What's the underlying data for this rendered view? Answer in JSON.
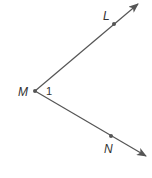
{
  "diagram": {
    "type": "angle",
    "vertex": {
      "label": "M",
      "x": 35,
      "y": 91
    },
    "rays": [
      {
        "name": "ray-ML",
        "point_label": "L",
        "point": {
          "x": 114,
          "y": 24
        },
        "tip": {
          "x": 138,
          "y": 4
        }
      },
      {
        "name": "ray-MN",
        "point_label": "N",
        "point": {
          "x": 111,
          "y": 136
        },
        "tip": {
          "x": 146,
          "y": 156
        }
      }
    ],
    "angle_label": "1",
    "colors": {
      "line": "#555555",
      "text": "#333333"
    }
  }
}
